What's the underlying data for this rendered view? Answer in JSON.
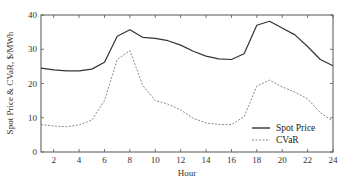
{
  "chart_data": {
    "type": "line",
    "title": "",
    "xlabel": "Hour",
    "ylabel": "Spot Price & CVaR, $/MWh",
    "xlim": [
      1,
      24
    ],
    "ylim": [
      0,
      40
    ],
    "x_ticks": [
      2,
      4,
      6,
      8,
      10,
      12,
      14,
      16,
      18,
      20,
      22,
      24
    ],
    "y_ticks": [
      0,
      10,
      20,
      30,
      40
    ],
    "grid": false,
    "legend_position": "lower right",
    "x": [
      1,
      2,
      3,
      4,
      5,
      6,
      7,
      8,
      9,
      10,
      11,
      12,
      13,
      14,
      15,
      16,
      17,
      18,
      19,
      20,
      21,
      22,
      23,
      24
    ],
    "series": [
      {
        "name": "Spot Price",
        "style": "solid",
        "color": "#333333",
        "values": [
          24.5,
          24.0,
          23.7,
          23.7,
          24.2,
          26.2,
          33.8,
          35.7,
          33.5,
          33.2,
          32.5,
          31.2,
          29.4,
          28.0,
          27.2,
          27.0,
          28.7,
          37.0,
          38.2,
          36.2,
          34.2,
          30.8,
          27.0,
          25.2
        ]
      },
      {
        "name": "CVaR",
        "style": "dashed",
        "color": "#888888",
        "values": [
          8.0,
          7.6,
          7.4,
          7.9,
          9.3,
          15.0,
          27.0,
          29.6,
          19.5,
          15.0,
          14.0,
          12.3,
          9.8,
          8.5,
          8.0,
          8.0,
          10.3,
          19.2,
          21.0,
          19.0,
          17.5,
          15.5,
          11.5,
          9.0
        ]
      }
    ]
  },
  "legend": {
    "items": [
      {
        "label": "Spot Price"
      },
      {
        "label": "CVaR"
      }
    ]
  }
}
